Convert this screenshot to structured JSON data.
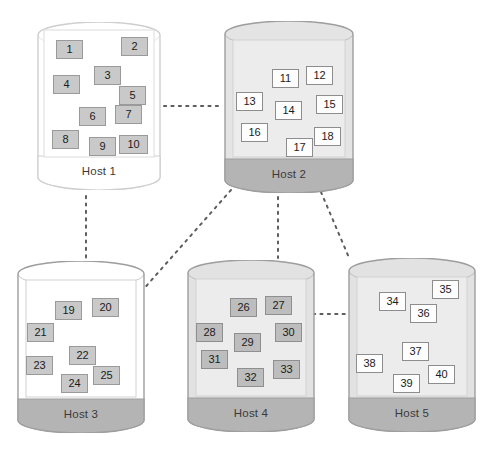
{
  "diagram": {
    "type": "node-link-diagram",
    "node_shape": "cylinder",
    "link_style": "dashed",
    "colors": {
      "link": "#5d5d5d",
      "body_white": "#ffffff",
      "body_light_gray": "#e2e2e2",
      "band_gray": "#b4b4b4",
      "band_white": "#ffffff",
      "vm_gray": "#c9c9c9",
      "vm_white": "#fdfdfd",
      "text": "#1b1b1b",
      "label_text": "#3a3a3a"
    }
  },
  "hosts": [
    {
      "id": "host1",
      "label": "Host 1",
      "body_fill": "#ffffff",
      "band_fill": "#ffffff",
      "stroke": "#cfcfcf",
      "vm_style": "gray",
      "geom": {
        "x": 37,
        "y": 22,
        "w": 124,
        "h": 168,
        "band": 34
      },
      "vms": [
        {
          "n": "1",
          "x": 19,
          "y": 18,
          "w": 27,
          "h": 19
        },
        {
          "n": "2",
          "x": 84,
          "y": 15,
          "w": 27,
          "h": 19
        },
        {
          "n": "3",
          "x": 57,
          "y": 44,
          "w": 27,
          "h": 19
        },
        {
          "n": "4",
          "x": 16,
          "y": 53,
          "w": 27,
          "h": 19
        },
        {
          "n": "5",
          "x": 82,
          "y": 64,
          "w": 27,
          "h": 19
        },
        {
          "n": "6",
          "x": 42,
          "y": 85,
          "w": 27,
          "h": 19
        },
        {
          "n": "7",
          "x": 78,
          "y": 83,
          "w": 27,
          "h": 19
        },
        {
          "n": "8",
          "x": 15,
          "y": 108,
          "w": 27,
          "h": 19
        },
        {
          "n": "9",
          "x": 52,
          "y": 115,
          "w": 27,
          "h": 19
        },
        {
          "n": "10",
          "x": 82,
          "y": 113,
          "w": 29,
          "h": 19
        }
      ]
    },
    {
      "id": "host2",
      "label": "Host 2",
      "body_fill": "#e4e4e4",
      "band_fill": "#b4b4b4",
      "stroke": "#9e9e9e",
      "vm_style": "white",
      "geom": {
        "x": 224,
        "y": 21,
        "w": 130,
        "h": 172,
        "band": 34
      },
      "vms": [
        {
          "n": "11",
          "x": 48,
          "y": 48,
          "w": 27,
          "h": 19
        },
        {
          "n": "12",
          "x": 82,
          "y": 45,
          "w": 27,
          "h": 19
        },
        {
          "n": "13",
          "x": 12,
          "y": 71,
          "w": 27,
          "h": 19
        },
        {
          "n": "14",
          "x": 51,
          "y": 80,
          "w": 27,
          "h": 19
        },
        {
          "n": "15",
          "x": 92,
          "y": 74,
          "w": 27,
          "h": 19
        },
        {
          "n": "16",
          "x": 17,
          "y": 102,
          "w": 27,
          "h": 19
        },
        {
          "n": "17",
          "x": 62,
          "y": 117,
          "w": 27,
          "h": 19
        },
        {
          "n": "18",
          "x": 90,
          "y": 106,
          "w": 27,
          "h": 19
        }
      ]
    },
    {
      "id": "host3",
      "label": "Host 3",
      "body_fill": "#ffffff",
      "band_fill": "#b4b4b4",
      "stroke": "#9e9e9e",
      "vm_style": "gray",
      "geom": {
        "x": 17,
        "y": 261,
        "w": 128,
        "h": 172,
        "band": 34
      },
      "vms": [
        {
          "n": "19",
          "x": 38,
          "y": 40,
          "w": 27,
          "h": 19
        },
        {
          "n": "20",
          "x": 75,
          "y": 37,
          "w": 27,
          "h": 19
        },
        {
          "n": "21",
          "x": 10,
          "y": 62,
          "w": 27,
          "h": 19
        },
        {
          "n": "22",
          "x": 52,
          "y": 85,
          "w": 27,
          "h": 19
        },
        {
          "n": "23",
          "x": 9,
          "y": 95,
          "w": 27,
          "h": 19
        },
        {
          "n": "24",
          "x": 44,
          "y": 113,
          "w": 27,
          "h": 19
        },
        {
          "n": "25",
          "x": 76,
          "y": 105,
          "w": 27,
          "h": 19
        }
      ]
    },
    {
      "id": "host4",
      "label": "Host 4",
      "body_fill": "#e2e2e2",
      "band_fill": "#b4b4b4",
      "stroke": "#9e9e9e",
      "vm_style": "grayer",
      "geom": {
        "x": 187,
        "y": 260,
        "w": 128,
        "h": 172,
        "band": 34
      },
      "vms": [
        {
          "n": "26",
          "x": 43,
          "y": 38,
          "w": 27,
          "h": 19
        },
        {
          "n": "27",
          "x": 78,
          "y": 36,
          "w": 27,
          "h": 19
        },
        {
          "n": "28",
          "x": 9,
          "y": 63,
          "w": 27,
          "h": 19
        },
        {
          "n": "29",
          "x": 47,
          "y": 73,
          "w": 27,
          "h": 19
        },
        {
          "n": "30",
          "x": 88,
          "y": 63,
          "w": 27,
          "h": 19
        },
        {
          "n": "31",
          "x": 14,
          "y": 90,
          "w": 27,
          "h": 19
        },
        {
          "n": "32",
          "x": 50,
          "y": 108,
          "w": 27,
          "h": 19
        },
        {
          "n": "33",
          "x": 86,
          "y": 100,
          "w": 27,
          "h": 19
        }
      ]
    },
    {
      "id": "host5",
      "label": "Host 5",
      "body_fill": "#e2e2e2",
      "band_fill": "#b4b4b4",
      "stroke": "#9e9e9e",
      "vm_style": "white",
      "geom": {
        "x": 348,
        "y": 258,
        "w": 128,
        "h": 174,
        "band": 34
      },
      "vms": [
        {
          "n": "34",
          "x": 31,
          "y": 34,
          "w": 27,
          "h": 19
        },
        {
          "n": "35",
          "x": 84,
          "y": 22,
          "w": 27,
          "h": 19
        },
        {
          "n": "36",
          "x": 62,
          "y": 46,
          "w": 27,
          "h": 19
        },
        {
          "n": "37",
          "x": 54,
          "y": 84,
          "w": 27,
          "h": 19
        },
        {
          "n": "38",
          "x": 8,
          "y": 96,
          "w": 27,
          "h": 19
        },
        {
          "n": "39",
          "x": 45,
          "y": 116,
          "w": 27,
          "h": 19
        },
        {
          "n": "40",
          "x": 80,
          "y": 107,
          "w": 27,
          "h": 19
        }
      ]
    }
  ],
  "links": [
    {
      "id": "link-host1-host2",
      "from": "host1",
      "to": "host2",
      "x1": 164,
      "y1": 106,
      "x2": 222,
      "y2": 106
    },
    {
      "id": "link-host1-host3",
      "from": "host1",
      "to": "host3",
      "x1": 86,
      "y1": 196,
      "x2": 86,
      "y2": 258
    },
    {
      "id": "link-host2-host3",
      "from": "host2",
      "to": "host3",
      "x1": 231,
      "y1": 190,
      "x2": 141,
      "y2": 292
    },
    {
      "id": "link-host2-host4",
      "from": "host2",
      "to": "host4",
      "x1": 278,
      "y1": 197,
      "x2": 278,
      "y2": 258
    },
    {
      "id": "link-host2-host5",
      "from": "host2",
      "to": "host5",
      "x1": 321,
      "y1": 192,
      "x2": 350,
      "y2": 260
    },
    {
      "id": "link-host4-host5",
      "from": "host4",
      "to": "host5",
      "x1": 313,
      "y1": 314,
      "x2": 347,
      "y2": 314
    }
  ]
}
